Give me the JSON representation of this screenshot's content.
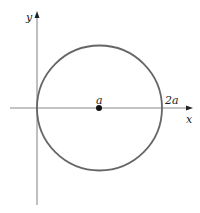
{
  "diagram": {
    "type": "circle-on-axes",
    "axes": {
      "x_label": "x",
      "y_label": "y"
    },
    "circle": {
      "center_label": "a",
      "right_intercept_label": "2a",
      "stroke_color": "#666666"
    },
    "colors": {
      "axis": "#888888",
      "point": "#111111",
      "text": "#222222"
    }
  }
}
